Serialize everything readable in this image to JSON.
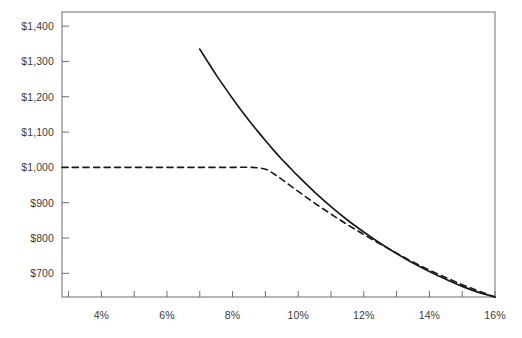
{
  "chart_data": {
    "type": "line",
    "title": "",
    "subtitle": "",
    "xlabel": "",
    "ylabel": "",
    "xlim": [
      2.8,
      16.0
    ],
    "ylim": [
      633,
      1440
    ],
    "grid": false,
    "legend": null,
    "x_tick_labels": [
      "4%",
      "6%",
      "8%",
      "10%",
      "12%",
      "14%",
      "16%"
    ],
    "x_tick_values": [
      4,
      6,
      8,
      10,
      12,
      14,
      16
    ],
    "x_minor_tick_values": [
      3,
      5,
      7,
      9,
      11,
      13,
      15
    ],
    "y_tick_labels": [
      "$1,400",
      "$1,300",
      "$1,200",
      "$1,100",
      "$1,000",
      "$900",
      "$800",
      "$700"
    ],
    "y_tick_values": [
      1400,
      1300,
      1200,
      1100,
      1000,
      900,
      800,
      700
    ],
    "series": [
      {
        "name": "solid-curve",
        "style": "solid",
        "color": "#1a1a1a",
        "x": [
          7.0,
          7.25,
          7.5,
          7.75,
          8.0,
          8.25,
          8.5,
          8.75,
          9.0,
          9.25,
          9.5,
          9.75,
          10.0,
          10.5,
          11.0,
          11.5,
          12.0,
          12.5,
          13.0,
          13.5,
          14.0,
          14.5,
          15.0,
          15.5,
          16.0
        ],
        "y": [
          1335,
          1298,
          1262,
          1228,
          1195,
          1163,
          1133,
          1104,
          1076,
          1049,
          1023,
          999,
          975,
          930,
          889,
          851,
          817,
          785,
          756,
          729,
          705,
          683,
          663,
          646,
          633
        ]
      },
      {
        "name": "dashed-curve",
        "style": "dashed",
        "color": "#1a1a1a",
        "x": [
          2.8,
          4.0,
          5.0,
          6.0,
          7.0,
          8.0,
          8.6,
          9.0,
          9.25,
          9.5,
          10.0,
          10.5,
          11.0,
          11.5,
          12.0,
          12.5,
          13.0,
          13.5,
          14.0,
          14.5,
          15.0,
          15.5,
          16.0
        ],
        "y": [
          1000,
          1000,
          1000,
          1000,
          1000,
          1000,
          1000,
          995,
          982,
          966,
          932,
          899,
          868,
          838,
          810,
          783,
          757,
          732,
          709,
          688,
          668,
          650,
          633
        ]
      }
    ],
    "colors": {
      "axis": "#6e6e6e",
      "line": "#1a1a1a",
      "text": "#3c3c3c",
      "background": "#ffffff"
    },
    "geometry": {
      "plot_left": 62,
      "plot_right": 495,
      "plot_top": 12,
      "plot_bottom": 297
    }
  }
}
